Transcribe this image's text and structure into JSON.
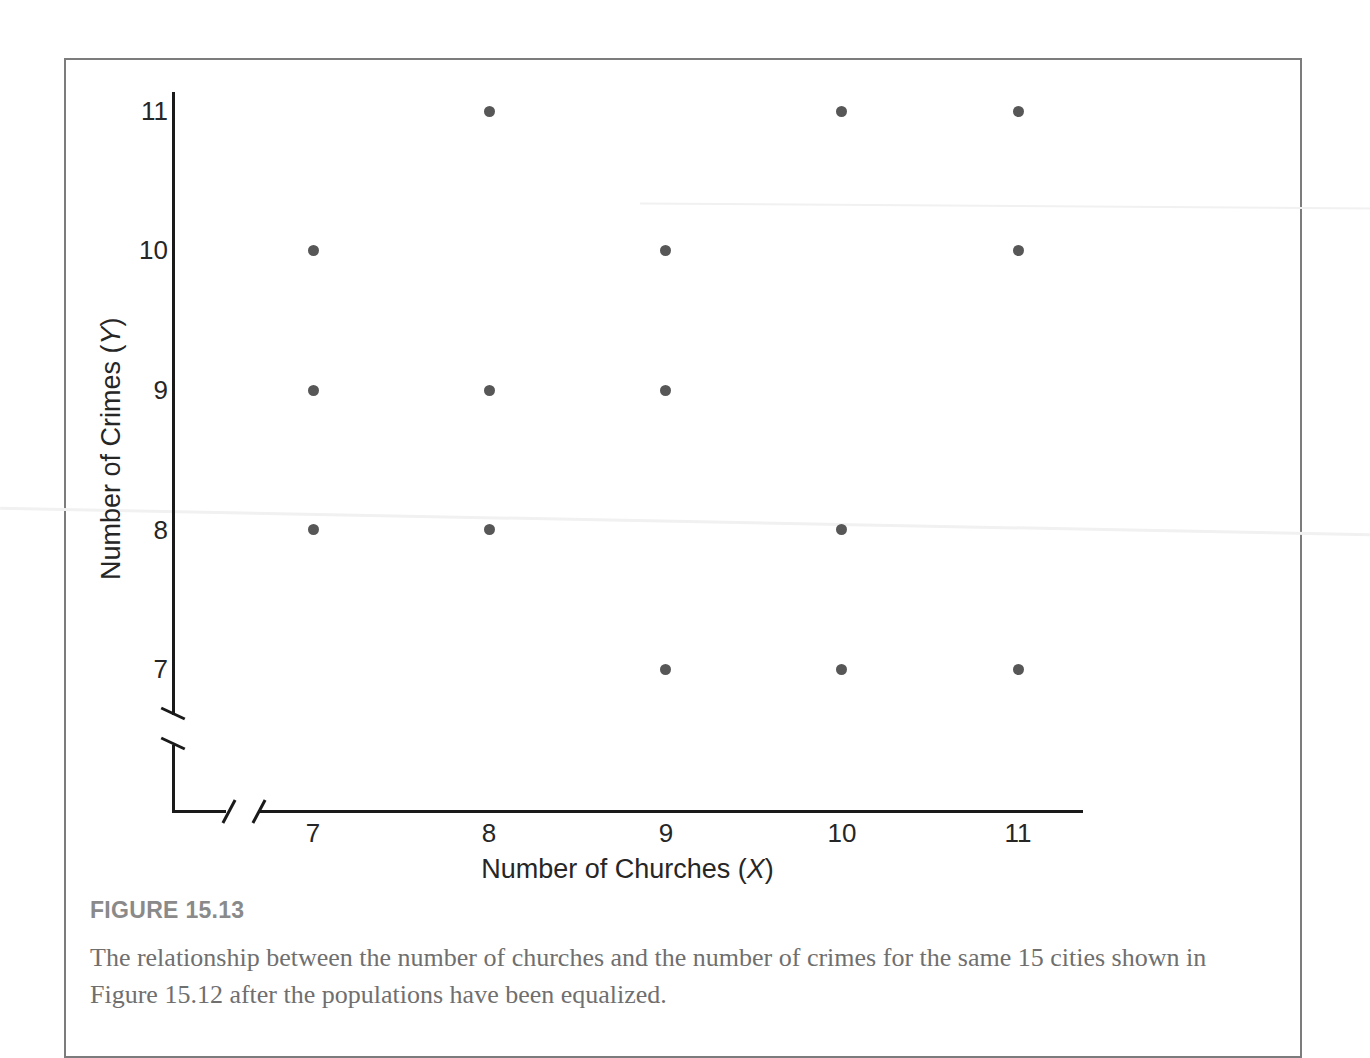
{
  "figure": {
    "caption_heading": "FIGURE 15.13",
    "caption_text": "The relationship between the number of churches and the number of crimes for the same 15 cities shown in Figure 15.12 after the populations have been equalized.",
    "frame_color": "#7c7c7c"
  },
  "chart_data": {
    "type": "scatter",
    "title": "",
    "xlabel": "Number of Churches (X)",
    "xlabel_text": "Number of Churches (",
    "xlabel_var": "X",
    "ylabel": "Number of Crimes (Y)",
    "ylabel_text": "Number of Crimes (",
    "ylabel_var": "Y",
    "x": [
      8,
      10,
      11,
      7,
      9,
      11,
      7,
      8,
      9,
      7,
      8,
      10,
      9,
      10,
      11
    ],
    "y": [
      11,
      11,
      11,
      10,
      10,
      10,
      9,
      9,
      9,
      8,
      8,
      8,
      7,
      7,
      7
    ],
    "points": [
      {
        "x": 8,
        "y": 11
      },
      {
        "x": 10,
        "y": 11
      },
      {
        "x": 11,
        "y": 11
      },
      {
        "x": 7,
        "y": 10
      },
      {
        "x": 9,
        "y": 10
      },
      {
        "x": 11,
        "y": 10
      },
      {
        "x": 7,
        "y": 9
      },
      {
        "x": 8,
        "y": 9
      },
      {
        "x": 9,
        "y": 9
      },
      {
        "x": 7,
        "y": 8
      },
      {
        "x": 8,
        "y": 8
      },
      {
        "x": 10,
        "y": 8
      },
      {
        "x": 9,
        "y": 7
      },
      {
        "x": 10,
        "y": 7
      },
      {
        "x": 11,
        "y": 7
      }
    ],
    "n_points": 15,
    "xticks": [
      7,
      8,
      9,
      10,
      11
    ],
    "yticks": [
      7,
      8,
      9,
      10,
      11
    ],
    "xlim": [
      7,
      11
    ],
    "ylim": [
      7,
      11
    ],
    "grid": false,
    "legend": "none",
    "axis_break_x": true,
    "axis_break_y": true,
    "marker_color": "#575757",
    "axis_color": "#1a1a1a"
  }
}
